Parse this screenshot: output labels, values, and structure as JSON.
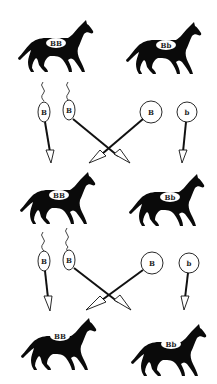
{
  "generations": [
    {
      "horses": [
        {
          "genotype": "BB",
          "side": "left"
        },
        {
          "genotype": "Bb",
          "side": "right"
        }
      ],
      "gametes": [
        {
          "type": "sperm",
          "allele": "B"
        },
        {
          "type": "sperm",
          "allele": "B"
        },
        {
          "type": "egg",
          "allele": "B"
        },
        {
          "type": "egg",
          "allele": "b"
        }
      ]
    },
    {
      "horses": [
        {
          "genotype": "BB",
          "side": "left"
        },
        {
          "genotype": "Bb",
          "side": "right"
        }
      ],
      "gametes": [
        {
          "type": "sperm",
          "allele": "B"
        },
        {
          "type": "sperm",
          "allele": "B"
        },
        {
          "type": "egg",
          "allele": "B"
        },
        {
          "type": "egg",
          "allele": "b"
        }
      ]
    },
    {
      "horses": [
        {
          "genotype": "BB",
          "side": "left"
        },
        {
          "genotype": "Bb",
          "side": "right"
        }
      ]
    }
  ],
  "colors": {
    "horse": "#0a0a0a",
    "line": "#111111",
    "background": "#ffffff"
  }
}
